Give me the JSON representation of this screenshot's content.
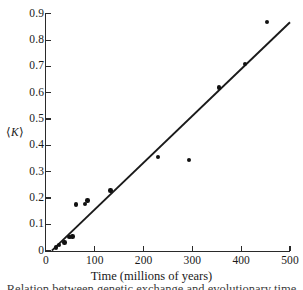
{
  "chart_data": {
    "type": "scatter",
    "title": "",
    "xlabel": "Time (millions of years)",
    "ylabel": "⟨K⟩",
    "xlim": [
      0,
      500
    ],
    "ylim": [
      0,
      0.9
    ],
    "grid": false,
    "legend": null,
    "xticks": [
      "0",
      "100",
      "200",
      "300",
      "400",
      "500"
    ],
    "xtick_values": [
      0,
      100,
      200,
      300,
      400,
      500
    ],
    "yticks": [
      "0",
      "0.1",
      "0.2",
      "0.3",
      "0.4",
      "0.5",
      "0.6",
      "0.7",
      "0.8",
      "0.9"
    ],
    "ytick_values": [
      0,
      0.1,
      0.2,
      0.3,
      0.4,
      0.5,
      0.6,
      0.7,
      0.8,
      0.9
    ],
    "series": [
      {
        "name": "observations",
        "marker": "filled-circle",
        "color": "#111111",
        "points": [
          {
            "x": 20,
            "y": 0.012
          },
          {
            "x": 26,
            "y": 0.022
          },
          {
            "x": 38,
            "y": 0.031
          },
          {
            "x": 48,
            "y": 0.051
          },
          {
            "x": 54,
            "y": 0.053
          },
          {
            "x": 62,
            "y": 0.175
          },
          {
            "x": 80,
            "y": 0.178
          },
          {
            "x": 85,
            "y": 0.19
          },
          {
            "x": 132,
            "y": 0.228
          },
          {
            "x": 230,
            "y": 0.355
          },
          {
            "x": 293,
            "y": 0.345
          },
          {
            "x": 355,
            "y": 0.62
          },
          {
            "x": 408,
            "y": 0.71
          },
          {
            "x": 453,
            "y": 0.868
          }
        ]
      }
    ],
    "fit_line": {
      "name": "linear-fit",
      "color": "#1a1a1a",
      "x_start": 12,
      "y_start": 0.0,
      "x_end": 500,
      "y_end": 0.868
    }
  },
  "axes": {
    "x_title": "Time (millions of years)",
    "y_title_prefix": "⟨",
    "y_title_symbol": "K",
    "y_title_suffix": "⟩"
  },
  "caption": {
    "cut_off_line": "Relation between genetic exchange and evolutionary time"
  }
}
